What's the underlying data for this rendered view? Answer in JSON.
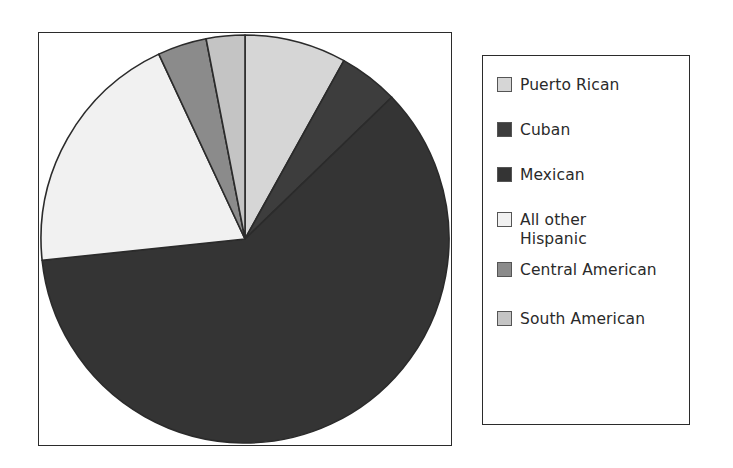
{
  "chart_data": {
    "type": "pie",
    "title": "",
    "subtitle": "",
    "legend_position": "right",
    "grid": false,
    "start_angle_deg": 0,
    "direction": "clockwise",
    "categories": [
      "Puerto Rican",
      "Cuban",
      "Mexican",
      "All other Hispanic",
      "Central American",
      "South American"
    ],
    "values": [
      8.1,
      4.7,
      60.6,
      19.7,
      3.9,
      3.0
    ],
    "unit": "percent",
    "slices": [
      {
        "label": "Puerto Rican",
        "value": 8.1,
        "color": "#d6d6d6",
        "start_angle_deg": 0,
        "end_angle_deg": 29
      },
      {
        "label": "Cuban",
        "value": 4.7,
        "color": "#3d3d3d",
        "start_angle_deg": 29,
        "end_angle_deg": 46
      },
      {
        "label": "Mexican",
        "value": 60.6,
        "color": "#343434",
        "start_angle_deg": 46,
        "end_angle_deg": 264
      },
      {
        "label": "All other Hispanic",
        "value": 19.7,
        "color": "#f1f1f1",
        "start_angle_deg": 264,
        "end_angle_deg": 335
      },
      {
        "label": "Central American",
        "value": 3.9,
        "color": "#8b8b8b",
        "start_angle_deg": 335,
        "end_angle_deg": 349
      },
      {
        "label": "South American",
        "value": 3.0,
        "color": "#c4c4c4",
        "start_angle_deg": 349,
        "end_angle_deg": 360
      }
    ]
  },
  "legend": {
    "items": [
      {
        "label": "Puerto Rican",
        "color": "#d6d6d6"
      },
      {
        "label": "Cuban",
        "color": "#3d3d3d"
      },
      {
        "label": "Mexican",
        "color": "#343434"
      },
      {
        "label": "All other\nHispanic",
        "color": "#f1f1f1"
      },
      {
        "label": "Central American",
        "color": "#8b8b8b"
      },
      {
        "label": "South American",
        "color": "#c4c4c4"
      }
    ]
  },
  "style": {
    "border_color": "#2b2b2b",
    "slice_outline_color": "#2b2b2b",
    "background": "#ffffff"
  }
}
